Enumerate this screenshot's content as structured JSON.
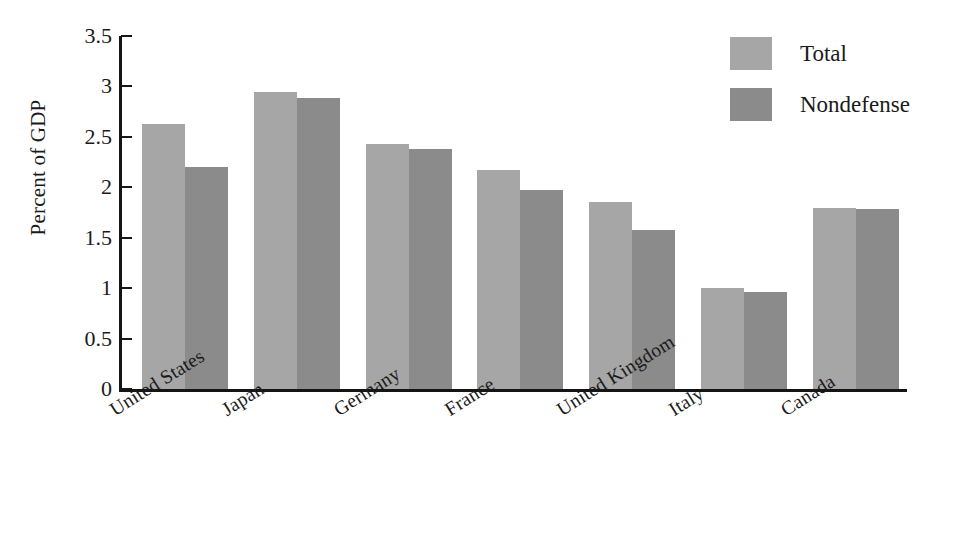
{
  "chart_data": {
    "type": "bar",
    "title": "",
    "subtitle": "",
    "xlabel": "",
    "ylabel": "Percent of GDP",
    "ylim": [
      0,
      3.5
    ],
    "ytick_values": [
      0,
      0.5,
      1,
      1.5,
      2,
      2.5,
      3,
      3.5
    ],
    "ytick_labels": [
      "0",
      "0.5",
      "1",
      "1.5",
      "2",
      "2.5",
      "3",
      "3.5"
    ],
    "grid": false,
    "legend_position": "top-right",
    "categories": [
      "United States",
      "Japan",
      "Germany",
      "France",
      "United Kingdom",
      "Italy",
      "Canada"
    ],
    "series": [
      {
        "name": "Total",
        "color": "#a6a6a6",
        "values": [
          2.63,
          2.94,
          2.43,
          2.17,
          1.85,
          1.0,
          1.79
        ]
      },
      {
        "name": "Nondefense",
        "color": "#8b8b8b",
        "values": [
          2.2,
          2.89,
          2.38,
          1.97,
          1.58,
          0.96,
          1.78
        ]
      }
    ],
    "annotations": []
  },
  "legend": {
    "items": [
      {
        "label": "Total",
        "swatch_class": "total"
      },
      {
        "label": "Nondefense",
        "swatch_class": "nondef"
      }
    ]
  },
  "axes": {
    "y_title": "Percent of GDP"
  },
  "colors": {
    "total": "#a6a6a6",
    "nondefense": "#8b8b8b",
    "axis": "#141414",
    "background": "#ffffff"
  }
}
